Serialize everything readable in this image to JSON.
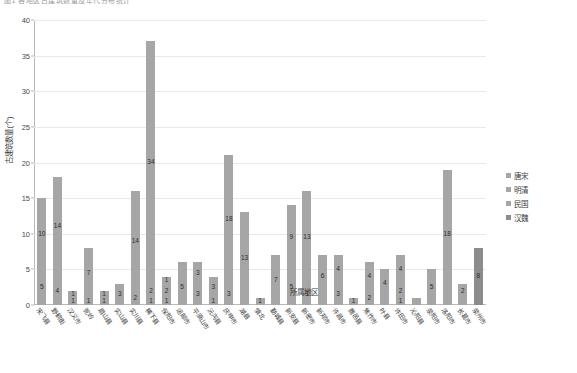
{
  "cut_title": "图1 各地区古建筑数量及年代分布统计",
  "axes": {
    "ylabel": "古建筑数量(个)",
    "xlabel": "所属地区",
    "yticks": [
      0,
      5,
      10,
      15,
      20,
      25,
      30,
      35,
      40
    ],
    "ylim": [
      0,
      40
    ]
  },
  "legend": {
    "position": "right",
    "items": [
      {
        "label": "唐宋",
        "color": "#a6a6a6"
      },
      {
        "label": "明清",
        "color": "#a6a6a6"
      },
      {
        "label": "民国",
        "color": "#a6a6a6"
      },
      {
        "label": "汉魏",
        "color": "#8c8c8c"
      }
    ]
  },
  "chart_data": {
    "type": "bar",
    "title": "图1 各地区古建筑数量及年代分布统计",
    "xlabel": "所属地区",
    "ylabel": "古建筑数量(个)",
    "ylim": [
      0,
      40
    ],
    "grid": true,
    "stacked": true,
    "categories": [
      "宋飞县",
      "野鹤街",
      "汉义市",
      "驼岭",
      "眉山县",
      "实山县",
      "实川县",
      "横下县",
      "保阳市",
      "运邮市",
      "平原山市",
      "沅沟县",
      "庆申市",
      "湖县",
      "慎北",
      "勤城县",
      "新安县",
      "新密市",
      "新郑市",
      "许昌市",
      "鹿邑县",
      "焦作市",
      "叶县",
      "许田市",
      "沁阳县",
      "荥阳市",
      "洛阳市",
      "长葛市",
      "荥州市"
    ],
    "series": [
      {
        "name": "唐宋",
        "values": [
          10,
          14,
          1,
          7,
          1,
          3,
          14,
          34,
          1,
          1,
          3,
          3,
          18,
          13,
          7,
          9,
          13,
          6,
          7,
          3,
          1,
          4,
          12,
          5,
          18,
          2,
          0,
          0,
          0
        ]
      },
      {
        "name": "明清",
        "values": [
          5,
          4,
          1,
          0,
          1,
          0,
          2,
          2,
          2,
          5,
          3,
          0,
          3,
          0,
          0,
          5,
          0,
          3,
          0,
          0,
          4,
          0,
          4,
          0,
          0,
          0,
          0,
          0,
          0
        ]
      },
      {
        "name": "民国",
        "values": [
          0,
          0,
          0,
          0,
          0,
          0,
          0,
          1,
          1,
          0,
          0,
          0,
          0,
          0,
          0,
          0,
          0,
          0,
          0,
          0,
          1,
          0,
          0,
          0,
          0,
          0,
          0,
          0,
          0
        ]
      },
      {
        "name": "汉魏",
        "values": [
          0,
          0,
          0,
          0,
          0,
          0,
          0,
          0,
          0,
          0,
          0,
          0,
          0,
          0,
          0,
          0,
          0,
          0,
          0,
          0,
          0,
          0,
          0,
          0,
          0,
          0,
          0,
          0,
          8
        ]
      }
    ],
    "bars": [
      {
        "category": "宋飞县",
        "total": 15,
        "segments": [
          {
            "series": "明清",
            "value": 5,
            "show": true
          },
          {
            "series": "唐宋",
            "value": 10,
            "show": true
          }
        ]
      },
      {
        "category": "野鹤街",
        "total": 18,
        "segments": [
          {
            "series": "明清",
            "value": 4,
            "show": true
          },
          {
            "series": "唐宋",
            "value": 14,
            "show": true
          }
        ]
      },
      {
        "category": "汉义市",
        "total": 2,
        "segments": [
          {
            "series": "明清",
            "value": 1,
            "show": true
          },
          {
            "series": "唐宋",
            "value": 1,
            "show": true
          }
        ]
      },
      {
        "category": "驼岭",
        "total": 8,
        "segments": [
          {
            "series": "明清",
            "value": 1,
            "show": true
          },
          {
            "series": "唐宋",
            "value": 7,
            "show": true
          }
        ]
      },
      {
        "category": "眉山县",
        "total": 2,
        "segments": [
          {
            "series": "明清",
            "value": 1,
            "show": true
          },
          {
            "series": "唐宋",
            "value": 1,
            "show": true
          }
        ]
      },
      {
        "category": "实山县",
        "total": 3,
        "segments": [
          {
            "series": "唐宋",
            "value": 3,
            "show": true
          }
        ]
      },
      {
        "category": "实川县",
        "total": 16,
        "segments": [
          {
            "series": "明清",
            "value": 2,
            "show": true
          },
          {
            "series": "唐宋",
            "value": 14,
            "show": true
          }
        ]
      },
      {
        "category": "横下县",
        "total": 37,
        "segments": [
          {
            "series": "民国",
            "value": 1,
            "show": true
          },
          {
            "series": "明清",
            "value": 2,
            "show": true
          },
          {
            "series": "唐宋",
            "value": 34,
            "show": true
          }
        ]
      },
      {
        "category": "保阳市",
        "total": 4,
        "segments": [
          {
            "series": "民国",
            "value": 1,
            "show": true
          },
          {
            "series": "明清",
            "value": 2,
            "show": true
          },
          {
            "series": "唐宋",
            "value": 1,
            "show": true
          }
        ]
      },
      {
        "category": "运邮市",
        "total": 5,
        "segments": [
          {
            "series": "明清",
            "value": 5,
            "show": true
          },
          {
            "series": "唐宋",
            "value": 1,
            "show": false
          }
        ]
      },
      {
        "category": "平原山市",
        "total": 6,
        "segments": [
          {
            "series": "明清",
            "value": 3,
            "show": true
          },
          {
            "series": "唐宋",
            "value": 3,
            "show": true
          }
        ]
      },
      {
        "category": "沅沟县",
        "total": 4,
        "segments": [
          {
            "series": "明清",
            "value": 1,
            "show": true
          },
          {
            "series": "唐宋",
            "value": 3,
            "show": true
          }
        ]
      },
      {
        "category": "庆申市",
        "total": 21,
        "segments": [
          {
            "series": "明清",
            "value": 3,
            "show": true
          },
          {
            "series": "唐宋",
            "value": 18,
            "show": true
          }
        ]
      },
      {
        "category": "湖县",
        "total": 13,
        "segments": [
          {
            "series": "唐宋",
            "value": 13,
            "show": true
          }
        ]
      },
      {
        "category": "慎北",
        "total": 1,
        "segments": [
          {
            "series": "唐宋",
            "value": 1,
            "show": true
          }
        ]
      },
      {
        "category": "勤城县",
        "total": 7,
        "segments": [
          {
            "series": "唐宋",
            "value": 7,
            "show": true
          }
        ]
      },
      {
        "category": "新安县",
        "total": 14,
        "segments": [
          {
            "series": "明清",
            "value": 5,
            "show": true
          },
          {
            "series": "唐宋",
            "value": 9,
            "show": true
          }
        ]
      },
      {
        "category": "新密市",
        "total": 16,
        "segments": [
          {
            "series": "明清",
            "value": 3,
            "show": true
          },
          {
            "series": "唐宋",
            "value": 13,
            "show": true
          }
        ]
      },
      {
        "category": "新郑市",
        "total": 7,
        "segments": [
          {
            "series": "明清",
            "value": 1,
            "show": false
          },
          {
            "series": "唐宋",
            "value": 6,
            "show": true
          }
        ]
      },
      {
        "category": "许昌市",
        "total": 7,
        "segments": [
          {
            "series": "明清",
            "value": 3,
            "show": true
          },
          {
            "series": "唐宋",
            "value": 4,
            "show": true
          }
        ]
      },
      {
        "category": "鹿邑县",
        "total": 1,
        "segments": [
          {
            "series": "唐宋",
            "value": 1,
            "show": true
          }
        ]
      },
      {
        "category": "焦作市",
        "total": 6,
        "segments": [
          {
            "series": "明清",
            "value": 2,
            "show": true
          },
          {
            "series": "唐宋",
            "value": 4,
            "show": true
          }
        ]
      },
      {
        "category": "叶县",
        "total": 4,
        "segments": [
          {
            "series": "明清",
            "value": 1,
            "show": false
          },
          {
            "series": "唐宋",
            "value": 4,
            "show": true
          }
        ]
      },
      {
        "category": "许田市",
        "total": 7,
        "segments": [
          {
            "series": "民国",
            "value": 1,
            "show": true
          },
          {
            "series": "明清",
            "value": 2,
            "show": true
          },
          {
            "series": "唐宋",
            "value": 4,
            "show": true
          }
        ]
      },
      {
        "category": "沁阳县",
        "total": 1,
        "segments": [
          {
            "series": "唐宋",
            "value": 1,
            "show": false
          }
        ]
      },
      {
        "category": "荥阳市",
        "total": 5,
        "segments": [
          {
            "series": "唐宋",
            "value": 5,
            "show": true
          }
        ]
      },
      {
        "category": "洛阳市",
        "total": 19,
        "segments": [
          {
            "series": "明清",
            "value": 1,
            "show": false
          },
          {
            "series": "唐宋",
            "value": 18,
            "show": true
          }
        ]
      },
      {
        "category": "长葛市",
        "total": 3,
        "segments": [
          {
            "series": "明清",
            "value": 1,
            "show": false
          },
          {
            "series": "唐宋",
            "value": 2,
            "show": true
          }
        ]
      },
      {
        "category": "荥州市",
        "total": 8,
        "segments": [
          {
            "series": "汉魏",
            "value": 8,
            "show": true
          }
        ]
      }
    ]
  }
}
